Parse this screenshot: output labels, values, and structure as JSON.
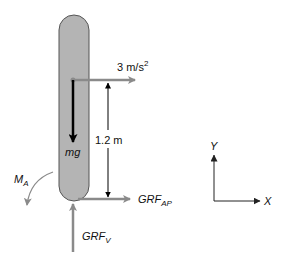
{
  "figure": {
    "type": "free-body-diagram",
    "segment": {
      "shape": "capsule",
      "fill": "#b4b4b4",
      "stroke": "#555555"
    },
    "labels": {
      "acceleration": "3 m/s",
      "acceleration_exp": "2",
      "distance": "1.2 m",
      "weight": "mg",
      "moment_main": "M",
      "moment_sub": "A",
      "grf_ap_main": "GRF",
      "grf_ap_sub": "AP",
      "grf_v_main": "GRF",
      "grf_v_sub": "V",
      "axis_y": "Y",
      "axis_x": "X"
    },
    "colors": {
      "force_arrow": "#8a8a8a",
      "weight_arrow": "#000000",
      "dimension_line": "#000000",
      "axis": "#333333"
    }
  }
}
